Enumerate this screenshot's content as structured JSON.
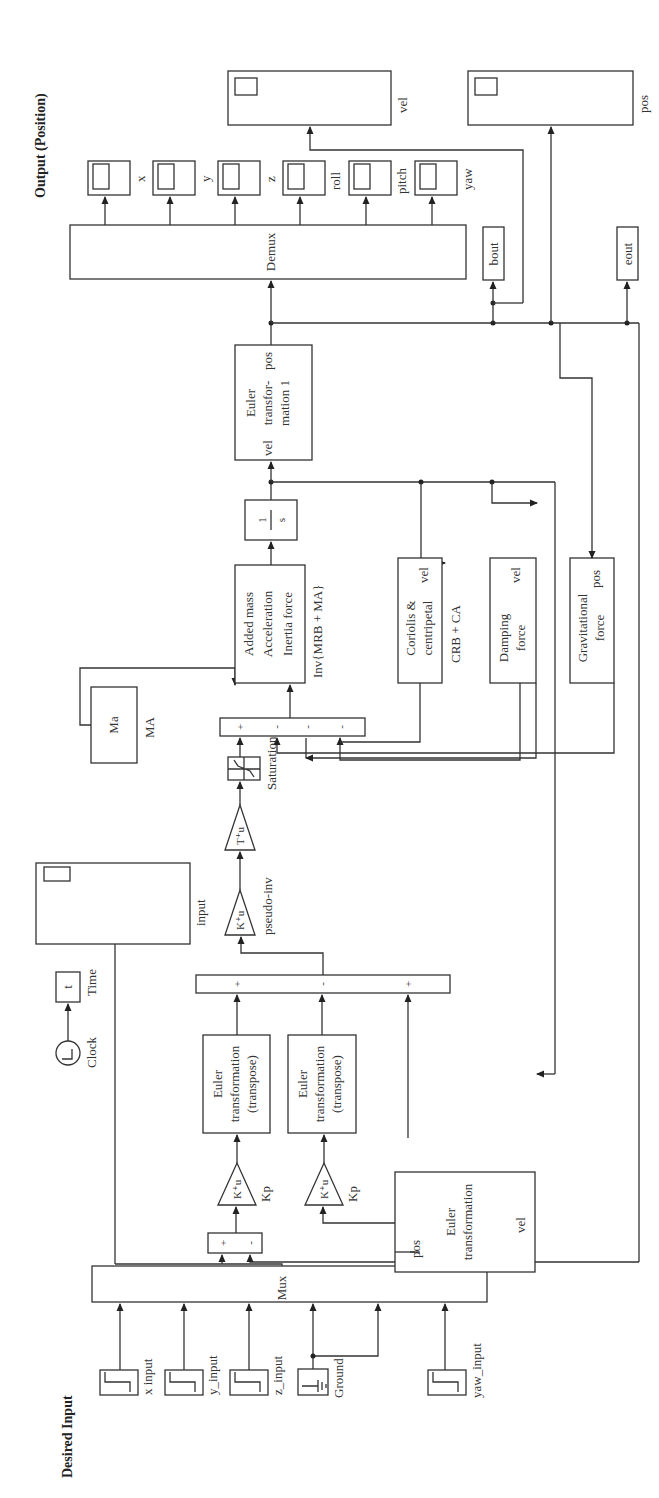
{
  "diagram": {
    "type": "simulink-block-diagram",
    "orientation": "rotated-90-ccw",
    "sections": {
      "input_title": "Desired Input",
      "output_title": "Output (Position)"
    },
    "sources": [
      {
        "id": "x_input",
        "label": "x input"
      },
      {
        "id": "y_input",
        "label": "y_input"
      },
      {
        "id": "z_input",
        "label": "z_input"
      },
      {
        "id": "ground",
        "label": "Ground"
      },
      {
        "id": "yaw_input",
        "label": "yaw_input"
      }
    ],
    "clock": {
      "label": "Clock",
      "out_label": "t",
      "out_name": "Time"
    },
    "mux": {
      "label": "Mux"
    },
    "sum1": {
      "signs": [
        "+",
        "-"
      ]
    },
    "gains": {
      "kp1": {
        "text": "K⁺u",
        "label": "Kp"
      },
      "kp2": {
        "text": "K⁺u",
        "label": "Kp"
      },
      "pseudo_inv": {
        "text": "K⁺u",
        "label": "pseudo-inv"
      },
      "t_gain": {
        "text": "T⁺u",
        "label": ""
      }
    },
    "euler_transpose_1": {
      "lines": [
        "Euler",
        "transformation",
        "(transpose)"
      ]
    },
    "euler_transpose_2": {
      "lines": [
        "Euler",
        "transformation",
        "(transpose)"
      ]
    },
    "euler_transformation": {
      "lines": [
        "Euler",
        "transformation"
      ],
      "port_in": "vel",
      "port_out": "pos"
    },
    "sum_big": {
      "signs": [
        "+",
        "-",
        "+"
      ]
    },
    "input_scope": {
      "label": "input"
    },
    "saturation": {
      "label": "Saturation"
    },
    "sum4": {
      "signs": [
        "+",
        "-",
        "-",
        "-"
      ]
    },
    "ma_block": {
      "text": "Ma",
      "label": "MA"
    },
    "added_mass": {
      "lines": [
        "Added mass",
        "Acceleration",
        "Inertia force"
      ],
      "label": "Inv{MRB + MA}"
    },
    "integrator": {
      "num": "1",
      "den": "s"
    },
    "coriolis": {
      "lines": [
        "Coriolis &",
        "centripetal"
      ],
      "port": "vel",
      "label": "CRB + CA"
    },
    "damping": {
      "lines": [
        "Damping",
        "force"
      ],
      "port": "vel"
    },
    "gravitational": {
      "lines": [
        "Gravitational",
        "force"
      ],
      "port": "pos"
    },
    "euler_transformation_1": {
      "lines": [
        "Euler",
        "transfor-",
        "mation 1"
      ],
      "port_in": "vel",
      "port_out": "pos"
    },
    "demux": {
      "label": "Demux"
    },
    "output_scopes": [
      {
        "label": "x"
      },
      {
        "label": "y"
      },
      {
        "label": "z"
      },
      {
        "label": "roll"
      },
      {
        "label": "pitch"
      },
      {
        "label": "yaw"
      }
    ],
    "vel_scope": {
      "label": "vel"
    },
    "pos_scope": {
      "label": "pos"
    },
    "bout": {
      "label": "bout"
    },
    "eout": {
      "label": "eout"
    }
  }
}
